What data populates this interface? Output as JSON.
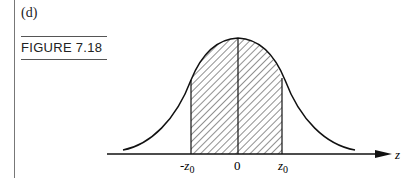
{
  "panel_label": "(d)",
  "figure_title": "FIGURE 7.18",
  "diagram": {
    "type": "normal-distribution-curve",
    "shaded_region": "between -z0 and z0 (hatched)",
    "axis_label": "z",
    "ticks": [
      "-z",
      "0",
      "z"
    ],
    "tick_subscripts": [
      "0",
      "",
      "0"
    ]
  }
}
